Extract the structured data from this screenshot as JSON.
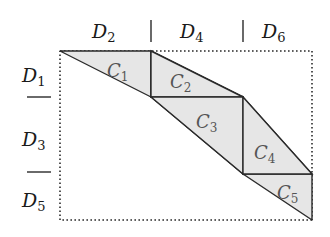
{
  "diagram": {
    "colors": {
      "background": "#ffffff",
      "stroke": "#2a2a2a",
      "shade": "#e6e6e6",
      "label": "#1a1a1a",
      "region_label": "#555555"
    },
    "column_labels": [
      {
        "base": "D",
        "sub": "2"
      },
      {
        "base": "D",
        "sub": "4"
      },
      {
        "base": "D",
        "sub": "6"
      }
    ],
    "column_separators": [
      "|",
      "|"
    ],
    "row_labels": [
      {
        "base": "D",
        "sub": "1"
      },
      {
        "base": "D",
        "sub": "3"
      },
      {
        "base": "D",
        "sub": "5"
      }
    ],
    "row_separators": [
      "—",
      "—"
    ],
    "regions": [
      {
        "base": "C",
        "sub": "1"
      },
      {
        "base": "C",
        "sub": "2"
      },
      {
        "base": "C",
        "sub": "3"
      },
      {
        "base": "C",
        "sub": "4"
      },
      {
        "base": "C",
        "sub": "5"
      }
    ],
    "frame": {
      "style": "dotted",
      "left": 60,
      "top": 51,
      "right": 312,
      "bottom": 220
    }
  }
}
